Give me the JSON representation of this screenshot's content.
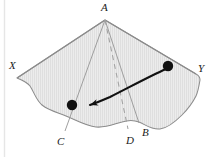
{
  "figure": {
    "colors": {
      "fill": "#ebebeb",
      "hatch": "#d8d8d8",
      "outline": "#7a7a7a",
      "edge_line": "#8a8a8a",
      "dashed_line": "#9a9a9a",
      "arrow": "#111111",
      "dot": "#111111",
      "label": "#1a1a1a",
      "background": "#ffffff",
      "left_rule": "#e2e2e2"
    },
    "labels": {
      "apex": "A",
      "left_corner": "X",
      "right_corner": "Y",
      "base_left": "C",
      "base_mid": "D",
      "base_right": "B"
    },
    "points": {
      "apex": {
        "x": 105,
        "y": 20
      },
      "left_corner": {
        "x": 17,
        "y": 78
      },
      "right_corner": {
        "x": 196,
        "y": 74
      },
      "base_left": {
        "x": 66,
        "y": 128
      },
      "base_mid": {
        "x": 130,
        "y": 126
      },
      "base_right": {
        "x": 139,
        "y": 120
      },
      "dot_start": {
        "x": 168,
        "y": 66
      },
      "dot_end": {
        "x": 72,
        "y": 105
      }
    },
    "annotations": {
      "dot_count": 2,
      "arrow_direction": "right-to-left",
      "dashed_edge": "A to D",
      "solid_edges": [
        "A to C",
        "A to B",
        "A to X",
        "A to Y"
      ]
    }
  }
}
